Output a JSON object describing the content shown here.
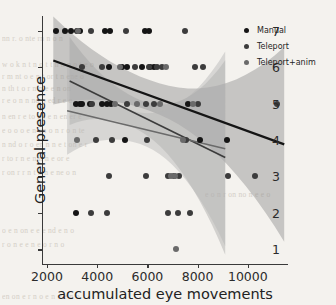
{
  "chart_data": {
    "type": "scatter",
    "title": "",
    "xlabel": "accumulated eye movements",
    "ylabel": "General presence",
    "xlim": [
      1800,
      11600
    ],
    "ylim": [
      0.6,
      7.4
    ],
    "xticks": [
      2000,
      4000,
      6000,
      8000,
      10000
    ],
    "yticks": [
      1,
      2,
      3,
      4,
      5,
      6,
      7
    ],
    "grid": false,
    "legend_position": "upper right",
    "series": [
      {
        "name": "Manual",
        "color": "#151515",
        "points": [
          [
            2350,
            7
          ],
          [
            2700,
            7
          ],
          [
            2950,
            7
          ],
          [
            3200,
            7
          ],
          [
            3300,
            7
          ],
          [
            4300,
            7
          ],
          [
            4500,
            7
          ],
          [
            5900,
            7
          ],
          [
            6050,
            7
          ],
          [
            4450,
            6
          ],
          [
            5000,
            6
          ],
          [
            5200,
            6
          ],
          [
            5800,
            6
          ],
          [
            6100,
            6
          ],
          [
            6250,
            6
          ],
          [
            3150,
            5
          ],
          [
            3300,
            5
          ],
          [
            3400,
            5
          ],
          [
            3700,
            5
          ],
          [
            4200,
            5
          ],
          [
            4400,
            5
          ],
          [
            4550,
            5
          ],
          [
            7600,
            5
          ],
          [
            5100,
            4
          ],
          [
            8100,
            4
          ],
          [
            9150,
            4
          ],
          [
            3150,
            2
          ]
        ],
        "regression": {
          "x0": 2250,
          "y0": 6.18,
          "x1": 11450,
          "y1": 3.88,
          "width": 2.2
        }
      },
      {
        "name": "Teleport",
        "color": "#3c3c3c",
        "points": [
          [
            3750,
            7
          ],
          [
            5150,
            7
          ],
          [
            7500,
            7
          ],
          [
            3400,
            6
          ],
          [
            4200,
            6
          ],
          [
            5500,
            6
          ],
          [
            6050,
            6
          ],
          [
            6400,
            6
          ],
          [
            6600,
            6
          ],
          [
            7900,
            6
          ],
          [
            8200,
            6
          ],
          [
            3800,
            5
          ],
          [
            5200,
            5
          ],
          [
            5950,
            5
          ],
          [
            6250,
            5
          ],
          [
            8000,
            5
          ],
          [
            11150,
            5
          ],
          [
            3950,
            4
          ],
          [
            4600,
            4
          ],
          [
            6000,
            4
          ],
          [
            7550,
            4
          ],
          [
            4450,
            3
          ],
          [
            5950,
            3
          ],
          [
            6800,
            3
          ],
          [
            7050,
            3
          ],
          [
            7250,
            3
          ],
          [
            9200,
            3
          ],
          [
            10300,
            3
          ],
          [
            3750,
            2
          ],
          [
            4400,
            2
          ],
          [
            6800,
            2
          ],
          [
            7200,
            2
          ],
          [
            7700,
            2
          ]
        ],
        "regression": {
          "x0": 2900,
          "y0": 5.62,
          "x1": 9100,
          "y1": 3.52,
          "width": 1.6
        }
      },
      {
        "name": "Teleport+anim",
        "color": "#6a6a6a",
        "points": [
          [
            3250,
            7
          ],
          [
            4900,
            6
          ],
          [
            6750,
            6
          ],
          [
            4700,
            5
          ],
          [
            5600,
            5
          ],
          [
            6500,
            5
          ],
          [
            7800,
            5
          ],
          [
            3200,
            4
          ],
          [
            7400,
            4
          ],
          [
            6950,
            3
          ],
          [
            7100,
            3
          ],
          [
            7150,
            1
          ]
        ],
        "regression": {
          "x0": 2800,
          "y0": 4.8,
          "x1": 9100,
          "y1": 3.76,
          "width": 1.5
        }
      }
    ],
    "confidence_bands": [
      {
        "name": "Manual",
        "fill": "#8e8e8e",
        "opacity": 0.45
      },
      {
        "name": "Teleport",
        "fill": "#9a9a9a",
        "opacity": 0.38
      },
      {
        "name": "Teleport+anim",
        "fill": "#b4b4b4",
        "opacity": 0.45
      }
    ]
  },
  "legend": {
    "items": [
      {
        "label": "Manual",
        "color": "#151515"
      },
      {
        "label": "Teleport",
        "color": "#3c3c3c"
      },
      {
        "label": "Teleport+anim",
        "color": "#6a6a6a"
      }
    ]
  },
  "background_text": [
    {
      "text": "nn r.  o nte  rn  n o  n",
      "x": 2,
      "y": 34
    },
    {
      "text": "w o k  n  t  n  o  t  t n   n   n  o t e o",
      "x": 2,
      "y": 60
    },
    {
      "text": "r  m  nt o  e  n  t  or  t    n  ene o",
      "x": 2,
      "y": 72
    },
    {
      "text": "n   th     t o   r  n  n  e    e   n   on",
      "x": 2,
      "y": 84
    },
    {
      "text": "r  e   o  n  n   nd   o ed    r  e  o",
      "x": 2,
      "y": 96
    },
    {
      "text": "n   en   r e  to  nd  e   n   en  er  e",
      "x": 2,
      "y": 112
    },
    {
      "text": "e  o  o o  e  n  on o n     r  o   n    te",
      "x": 2,
      "y": 126
    },
    {
      "text": "n  nd  o r o en     n  n e  t  on   e  r",
      "x": 2,
      "y": 140
    },
    {
      "text": "r   to r   n   e  n  n    n  e  or  e",
      "x": 2,
      "y": 154
    },
    {
      "text": "r  on   r  r  n t  n  n  e  ne  o  n",
      "x": 2,
      "y": 168
    },
    {
      "text": "e  o  n   r   on  no  n   e   e  o",
      "x": 205,
      "y": 190
    },
    {
      "text": "o   e    n  on  e  e   e   nd  e  n  o",
      "x": 2,
      "y": 226
    },
    {
      "text": "r   o  n   e  e  n   e   o   r  n  o",
      "x": 2,
      "y": 240
    },
    {
      "text": "en  on   e  r  n  o   e  n   o   e n  o",
      "x": 2,
      "y": 292
    }
  ]
}
